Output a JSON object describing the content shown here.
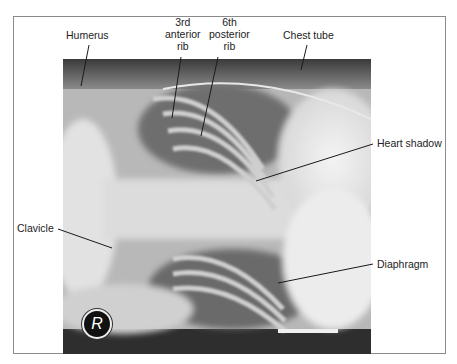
{
  "figure": {
    "type": "annotated chest radiograph",
    "orientation_marker": "R",
    "labels": {
      "humerus": "Humerus",
      "anterior_rib": [
        "3rd",
        "anterior",
        "rib"
      ],
      "posterior_rib": [
        "6th",
        "posterior",
        "rib"
      ],
      "chest_tube": "Chest tube",
      "heart_shadow": "Heart shadow",
      "clavicle": "Clavicle",
      "diaphragm": "Diaphragm"
    }
  }
}
